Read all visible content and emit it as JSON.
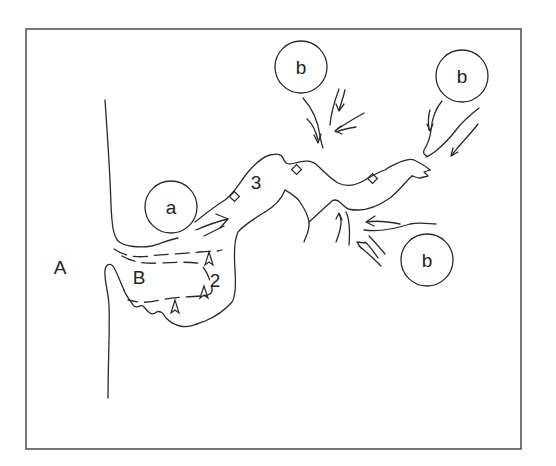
{
  "diagram": {
    "type": "geomorphological-sketch",
    "frame": {
      "x": 26,
      "y": 28,
      "width": 495,
      "height": 421
    },
    "colors": {
      "line": "#2a2a2a",
      "frame": "#555555",
      "background": "#ffffff"
    },
    "labels": {
      "region_A": "A",
      "region_B": "B",
      "zone_2": "2",
      "zone_3": "3",
      "circle_a": "a",
      "circle_b1": "b",
      "circle_b2": "b",
      "circle_b3": "b"
    },
    "circles": [
      {
        "id": "a",
        "label": "a",
        "cx": 171,
        "cy": 207,
        "r": 26
      },
      {
        "id": "b1",
        "label": "b",
        "cx": 301,
        "cy": 67,
        "r": 26
      },
      {
        "id": "b2",
        "label": "b",
        "cx": 462,
        "cy": 76,
        "r": 26
      },
      {
        "id": "b3",
        "label": "b",
        "cx": 427,
        "cy": 260,
        "r": 26
      }
    ],
    "markers": {
      "diamonds_count": 3,
      "chevrons_count": 3
    }
  }
}
